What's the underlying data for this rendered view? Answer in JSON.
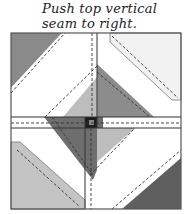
{
  "caption": {
    "line1": "Push top vertical",
    "line2": "seam to right."
  },
  "diagram": {
    "type": "quilt-block-pressing-diagram",
    "colors": {
      "dark": "#6b6b6b",
      "medium": "#8c8c8c",
      "light": "#bdbdbd",
      "lightest": "#f2f2f2",
      "white": "#ffffff",
      "center_square": "#222222",
      "outline": "#555555"
    }
  }
}
